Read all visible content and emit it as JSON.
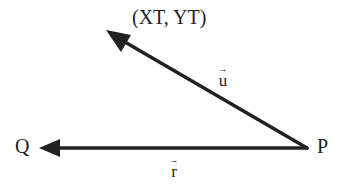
{
  "diagram": {
    "type": "vector-diagram",
    "points": {
      "P": {
        "label": "P"
      },
      "Q": {
        "label": "Q"
      },
      "target": {
        "label": "(XT, YT)"
      }
    },
    "vectors": [
      {
        "name": "u",
        "label": "u",
        "arrow": "→",
        "from": "P",
        "to": "target"
      },
      {
        "name": "r",
        "label": "r",
        "arrow": "→",
        "from": "P",
        "to": "Q"
      }
    ],
    "colors": {
      "line": "#222222",
      "background": "#ffffff"
    }
  }
}
